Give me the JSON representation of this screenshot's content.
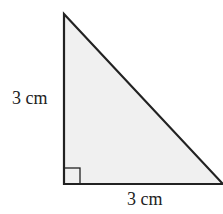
{
  "diagram": {
    "type": "right-triangle",
    "fill": "#f0f0f0",
    "stroke": "#222222",
    "labels": {
      "vertical_side": "3 cm",
      "horizontal_side": "3 cm"
    },
    "right_angle_marker": true
  }
}
